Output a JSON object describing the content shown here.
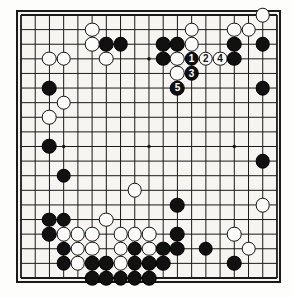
{
  "figure": {
    "name": "go-board-diagram",
    "board_size": 19,
    "background_color": "#f6f5f1",
    "line_color": "#1a1a1a",
    "black_color": "#111111",
    "white_color": "#fcfcfa"
  },
  "geometry": {
    "origin_x": 21,
    "origin_y": 15,
    "step_x": 14.22,
    "step_y": 14.61,
    "stone_diameter": 14.6,
    "star_points": [
      [
        3,
        3
      ],
      [
        9,
        3
      ],
      [
        15,
        3
      ],
      [
        3,
        9
      ],
      [
        9,
        9
      ],
      [
        15,
        9
      ],
      [
        3,
        15
      ],
      [
        9,
        15
      ],
      [
        15,
        15
      ]
    ]
  },
  "move_labels": {
    "1": "1",
    "2": "2",
    "3": "3",
    "4": "4",
    "5": "5"
  },
  "stones": [
    {
      "color": "white",
      "col": 17,
      "row": 0,
      "label": ""
    },
    {
      "color": "white",
      "col": 12,
      "row": 1,
      "label": ""
    },
    {
      "color": "white",
      "col": 15,
      "row": 1,
      "label": ""
    },
    {
      "color": "white",
      "col": 16,
      "row": 1,
      "label": ""
    },
    {
      "color": "white",
      "col": 5,
      "row": 1,
      "label": ""
    },
    {
      "color": "black",
      "col": 6,
      "row": 2,
      "label": ""
    },
    {
      "color": "black",
      "col": 7,
      "row": 2,
      "label": ""
    },
    {
      "color": "black",
      "col": 10,
      "row": 2,
      "label": ""
    },
    {
      "color": "black",
      "col": 11,
      "row": 2,
      "label": ""
    },
    {
      "color": "black",
      "col": 15,
      "row": 2,
      "label": ""
    },
    {
      "color": "black",
      "col": 17,
      "row": 2,
      "label": ""
    },
    {
      "color": "white",
      "col": 5,
      "row": 2,
      "label": ""
    },
    {
      "color": "white",
      "col": 12,
      "row": 2,
      "label": ""
    },
    {
      "color": "white",
      "col": 2,
      "row": 3,
      "label": ""
    },
    {
      "color": "white",
      "col": 3,
      "row": 3,
      "label": ""
    },
    {
      "color": "white",
      "col": 6,
      "row": 3,
      "label": ""
    },
    {
      "color": "black",
      "col": 10,
      "row": 3,
      "label": ""
    },
    {
      "color": "white",
      "col": 11,
      "row": 3,
      "label": ""
    },
    {
      "color": "black",
      "col": 12,
      "row": 3,
      "label": "1"
    },
    {
      "color": "white",
      "col": 13,
      "row": 3,
      "label": "2"
    },
    {
      "color": "white",
      "col": 14,
      "row": 3,
      "label": "4"
    },
    {
      "color": "black",
      "col": 15,
      "row": 3,
      "label": ""
    },
    {
      "color": "white",
      "col": 11,
      "row": 4,
      "label": ""
    },
    {
      "color": "black",
      "col": 12,
      "row": 4,
      "label": "3"
    },
    {
      "color": "black",
      "col": 11,
      "row": 5,
      "label": "5"
    },
    {
      "color": "black",
      "col": 17,
      "row": 5,
      "label": ""
    },
    {
      "color": "black",
      "col": 2,
      "row": 5,
      "label": ""
    },
    {
      "color": "white",
      "col": 3,
      "row": 6,
      "label": ""
    },
    {
      "color": "white",
      "col": 2,
      "row": 7,
      "label": ""
    },
    {
      "color": "black",
      "col": 2,
      "row": 9,
      "label": ""
    },
    {
      "color": "black",
      "col": 17,
      "row": 10,
      "label": ""
    },
    {
      "color": "black",
      "col": 3,
      "row": 11,
      "label": ""
    },
    {
      "color": "white",
      "col": 8,
      "row": 12,
      "label": ""
    },
    {
      "color": "black",
      "col": 11,
      "row": 13,
      "label": ""
    },
    {
      "color": "white",
      "col": 17,
      "row": 13,
      "label": ""
    },
    {
      "color": "black",
      "col": 2,
      "row": 14,
      "label": ""
    },
    {
      "color": "black",
      "col": 3,
      "row": 14,
      "label": ""
    },
    {
      "color": "white",
      "col": 6,
      "row": 14,
      "label": ""
    },
    {
      "color": "black",
      "col": 2,
      "row": 15,
      "label": ""
    },
    {
      "color": "white",
      "col": 3,
      "row": 15,
      "label": ""
    },
    {
      "color": "white",
      "col": 4,
      "row": 15,
      "label": ""
    },
    {
      "color": "white",
      "col": 5,
      "row": 15,
      "label": ""
    },
    {
      "color": "white",
      "col": 7,
      "row": 15,
      "label": ""
    },
    {
      "color": "white",
      "col": 8,
      "row": 15,
      "label": ""
    },
    {
      "color": "white",
      "col": 9,
      "row": 15,
      "label": ""
    },
    {
      "color": "black",
      "col": 11,
      "row": 15,
      "label": ""
    },
    {
      "color": "white",
      "col": 15,
      "row": 15,
      "label": ""
    },
    {
      "color": "black",
      "col": 3,
      "row": 16,
      "label": ""
    },
    {
      "color": "white",
      "col": 4,
      "row": 16,
      "label": ""
    },
    {
      "color": "white",
      "col": 5,
      "row": 16,
      "label": ""
    },
    {
      "color": "white",
      "col": 7,
      "row": 16,
      "label": ""
    },
    {
      "color": "black",
      "col": 8,
      "row": 16,
      "label": ""
    },
    {
      "color": "white",
      "col": 9,
      "row": 16,
      "label": ""
    },
    {
      "color": "black",
      "col": 10,
      "row": 16,
      "label": ""
    },
    {
      "color": "black",
      "col": 11,
      "row": 16,
      "label": ""
    },
    {
      "color": "black",
      "col": 13,
      "row": 16,
      "label": ""
    },
    {
      "color": "white",
      "col": 16,
      "row": 16,
      "label": ""
    },
    {
      "color": "black",
      "col": 3,
      "row": 17,
      "label": ""
    },
    {
      "color": "white",
      "col": 4,
      "row": 17,
      "label": ""
    },
    {
      "color": "black",
      "col": 5,
      "row": 17,
      "label": ""
    },
    {
      "color": "black",
      "col": 6,
      "row": 17,
      "label": ""
    },
    {
      "color": "white",
      "col": 7,
      "row": 17,
      "label": ""
    },
    {
      "color": "black",
      "col": 8,
      "row": 17,
      "label": ""
    },
    {
      "color": "black",
      "col": 9,
      "row": 17,
      "label": ""
    },
    {
      "color": "black",
      "col": 10,
      "row": 17,
      "label": ""
    },
    {
      "color": "black",
      "col": 15,
      "row": 17,
      "label": ""
    },
    {
      "color": "black",
      "col": 5,
      "row": 18,
      "label": ""
    },
    {
      "color": "black",
      "col": 6,
      "row": 18,
      "label": ""
    },
    {
      "color": "black",
      "col": 7,
      "row": 18,
      "label": ""
    },
    {
      "color": "black",
      "col": 8,
      "row": 18,
      "label": ""
    },
    {
      "color": "black",
      "col": 9,
      "row": 18,
      "label": ""
    }
  ]
}
